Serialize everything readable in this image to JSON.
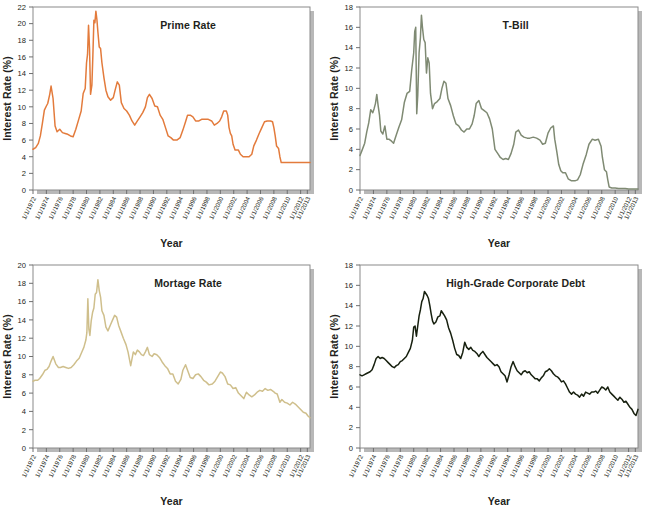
{
  "figure": {
    "name": "interest-rate-history-panels",
    "panel_count": 4,
    "background": "#ffffff"
  },
  "axis_common": {
    "ylabel": "Interest Rate (%)",
    "xlabel": "Year",
    "grid": false,
    "legend": "none",
    "xtick_labels": [
      "1/1/1972",
      "1/1/1974",
      "1/1/1976",
      "1/1/1978",
      "1/1/1980",
      "1/1/1982",
      "1/1/1984",
      "1/1/1986",
      "1/1/1988",
      "1/1/1990",
      "1/1/1992",
      "1/1/1994",
      "1/1/1996",
      "1/1/1998",
      "1/1/2000",
      "1/1/2002",
      "1/1/2004",
      "1/1/2006",
      "1/1/2008",
      "1/1/2010",
      "1/1/2012",
      "1/1/2013"
    ],
    "xtick_values": [
      1972,
      1974,
      1976,
      1978,
      1980,
      1982,
      1984,
      1986,
      1988,
      1990,
      1992,
      1994,
      1996,
      1998,
      2000,
      2002,
      2004,
      2006,
      2008,
      2010,
      2012,
      2013
    ],
    "xlim": [
      1972,
      2013.4
    ]
  },
  "chart_data": [
    {
      "type": "line",
      "panel": "top-left",
      "title": "Prime Rate",
      "color": "#E37B3C",
      "xlabel": "Year",
      "ylabel": "Interest Rate (%)",
      "xlim": [
        1972,
        2013.4
      ],
      "ylim": [
        0,
        22
      ],
      "ytick_values": [
        0,
        2,
        4,
        6,
        8,
        10,
        12,
        14,
        16,
        18,
        20,
        22
      ],
      "ytick_labels": [
        "0",
        "2",
        "4",
        "6",
        "8",
        "10",
        "12",
        "14",
        "16",
        "18",
        "20",
        "22"
      ],
      "x": [
        1972.0,
        1972.4,
        1972.8,
        1973.1,
        1973.4,
        1973.7,
        1974.0,
        1974.2,
        1974.5,
        1974.7,
        1975.0,
        1975.3,
        1975.6,
        1976.0,
        1976.4,
        1976.8,
        1977.2,
        1977.6,
        1978.0,
        1978.4,
        1978.8,
        1979.2,
        1979.5,
        1979.8,
        1980.0,
        1980.15,
        1980.3,
        1980.45,
        1980.6,
        1980.8,
        1980.95,
        1981.1,
        1981.25,
        1981.4,
        1981.55,
        1981.7,
        1981.9,
        1982.1,
        1982.3,
        1982.6,
        1982.9,
        1983.2,
        1983.6,
        1984.0,
        1984.3,
        1984.6,
        1984.9,
        1985.2,
        1985.6,
        1986.0,
        1986.4,
        1986.8,
        1987.2,
        1987.6,
        1988.0,
        1988.4,
        1988.8,
        1989.1,
        1989.4,
        1989.8,
        1990.2,
        1990.6,
        1991.0,
        1991.4,
        1991.8,
        1992.2,
        1992.6,
        1993.0,
        1993.5,
        1994.0,
        1994.4,
        1994.8,
        1995.1,
        1995.5,
        1995.9,
        1996.3,
        1996.8,
        1997.2,
        1997.7,
        1998.2,
        1998.7,
        1999.1,
        1999.5,
        1999.9,
        2000.2,
        2000.5,
        2000.9,
        2001.1,
        2001.3,
        2001.5,
        2001.7,
        2001.9,
        2002.2,
        2002.7,
        2003.0,
        2003.4,
        2003.8,
        2004.3,
        2004.7,
        2005.0,
        2005.4,
        2005.8,
        2006.2,
        2006.6,
        2007.0,
        2007.5,
        2007.8,
        2008.0,
        2008.2,
        2008.4,
        2008.7,
        2008.9,
        2009.1,
        2009.5,
        2010.0,
        2010.5,
        2011.0,
        2011.5,
        2012.0,
        2012.5,
        2013.0,
        2013.4
      ],
      "y": [
        4.9,
        5.1,
        5.6,
        6.5,
        8.0,
        9.6,
        10.1,
        10.4,
        11.5,
        12.5,
        11.0,
        7.7,
        7.0,
        7.3,
        6.9,
        6.8,
        6.7,
        6.5,
        6.4,
        7.3,
        8.4,
        9.5,
        11.6,
        12.2,
        15.3,
        16.3,
        19.8,
        17.0,
        11.5,
        12.6,
        16.2,
        20.4,
        20.1,
        21.5,
        20.5,
        19.0,
        17.2,
        17.0,
        15.3,
        13.5,
        12.0,
        11.2,
        10.8,
        11.1,
        12.1,
        13.0,
        12.6,
        10.5,
        9.8,
        9.5,
        9.0,
        8.3,
        7.8,
        8.3,
        8.8,
        9.3,
        10.0,
        11.1,
        11.5,
        11.0,
        10.1,
        10.0,
        9.0,
        8.5,
        7.5,
        6.5,
        6.3,
        6.0,
        6.0,
        6.3,
        7.2,
        8.2,
        9.0,
        9.0,
        8.8,
        8.3,
        8.3,
        8.5,
        8.5,
        8.5,
        8.3,
        7.8,
        8.0,
        8.3,
        8.8,
        9.5,
        9.5,
        9.0,
        7.5,
        6.8,
        6.5,
        5.5,
        4.8,
        4.8,
        4.3,
        4.0,
        4.0,
        4.0,
        4.3,
        5.3,
        6.0,
        6.8,
        7.5,
        8.2,
        8.3,
        8.3,
        8.2,
        7.5,
        6.5,
        5.3,
        5.0,
        4.0,
        3.3,
        3.3,
        3.3,
        3.3,
        3.3,
        3.3,
        3.3,
        3.3,
        3.3,
        3.3
      ]
    },
    {
      "type": "line",
      "panel": "top-right",
      "title": "T-Bill",
      "color": "#7F8A73",
      "xlabel": "Year",
      "ylabel": "Interest Rate (%)",
      "xlim": [
        1972,
        2013.4
      ],
      "ylim": [
        0,
        18
      ],
      "ytick_values": [
        0,
        2,
        4,
        6,
        8,
        10,
        12,
        14,
        16,
        18
      ],
      "ytick_labels": [
        "0",
        "2",
        "4",
        "6",
        "8",
        "10",
        "12",
        "14",
        "16",
        "18"
      ],
      "x": [
        1972.0,
        1972.3,
        1972.7,
        1973.0,
        1973.3,
        1973.6,
        1973.9,
        1974.1,
        1974.3,
        1974.5,
        1974.7,
        1974.9,
        1975.1,
        1975.4,
        1975.7,
        1976.0,
        1976.3,
        1976.7,
        1977.0,
        1977.4,
        1977.8,
        1978.2,
        1978.6,
        1979.0,
        1979.4,
        1979.7,
        1980.0,
        1980.15,
        1980.3,
        1980.45,
        1980.6,
        1980.8,
        1981.0,
        1981.15,
        1981.3,
        1981.5,
        1981.7,
        1981.9,
        1982.1,
        1982.3,
        1982.5,
        1982.8,
        1983.1,
        1983.5,
        1983.9,
        1984.2,
        1984.5,
        1984.8,
        1985.1,
        1985.5,
        1985.9,
        1986.3,
        1986.7,
        1987.1,
        1987.5,
        1987.9,
        1988.3,
        1988.7,
        1989.0,
        1989.3,
        1989.7,
        1990.1,
        1990.5,
        1990.9,
        1991.3,
        1991.7,
        1992.1,
        1992.5,
        1992.9,
        1993.3,
        1993.7,
        1994.1,
        1994.5,
        1994.9,
        1995.2,
        1995.6,
        1996.0,
        1996.4,
        1996.9,
        1997.3,
        1997.8,
        1998.3,
        1998.8,
        1999.2,
        1999.6,
        2000.0,
        2000.4,
        2000.8,
        2001.0,
        2001.3,
        2001.6,
        2001.9,
        2002.2,
        2002.6,
        2003.0,
        2003.5,
        2004.0,
        2004.4,
        2004.8,
        2005.2,
        2005.7,
        2006.1,
        2006.6,
        2007.0,
        2007.5,
        2007.9,
        2008.1,
        2008.4,
        2008.7,
        2008.9,
        2009.1,
        2009.5,
        2010.0,
        2010.5,
        2011.0,
        2011.5,
        2012.0,
        2012.5,
        2013.0,
        2013.4
      ],
      "y": [
        3.4,
        3.9,
        4.6,
        5.7,
        6.6,
        7.9,
        7.6,
        8.0,
        8.5,
        9.4,
        8.3,
        7.4,
        5.8,
        5.5,
        6.3,
        5.0,
        5.0,
        4.8,
        4.6,
        5.4,
        6.2,
        6.9,
        8.6,
        9.5,
        9.7,
        11.8,
        13.5,
        15.6,
        16.0,
        7.5,
        9.3,
        13.5,
        15.0,
        17.2,
        16.0,
        14.8,
        14.5,
        11.5,
        13.0,
        12.5,
        9.5,
        8.0,
        8.5,
        8.7,
        9.0,
        10.0,
        10.7,
        10.5,
        9.0,
        8.3,
        7.3,
        6.5,
        6.3,
        5.9,
        5.7,
        6.0,
        6.0,
        6.5,
        7.3,
        8.5,
        8.8,
        8.0,
        7.8,
        7.6,
        7.0,
        6.0,
        4.0,
        3.6,
        3.2,
        3.0,
        3.1,
        3.0,
        3.6,
        4.5,
        5.7,
        5.9,
        5.4,
        5.2,
        5.1,
        5.1,
        5.2,
        5.1,
        4.9,
        4.5,
        4.6,
        5.6,
        6.1,
        6.3,
        5.0,
        3.8,
        2.5,
        1.9,
        1.7,
        1.7,
        1.1,
        0.9,
        0.9,
        1.0,
        1.5,
        2.5,
        3.5,
        4.5,
        5.0,
        4.9,
        5.0,
        4.3,
        3.2,
        2.0,
        1.8,
        1.0,
        0.3,
        0.2,
        0.2,
        0.15,
        0.15,
        0.15,
        0.1,
        0.1,
        0.1,
        0.1,
        0.08,
        0.08
      ]
    },
    {
      "type": "line",
      "panel": "bottom-left",
      "title": "Mortage Rate",
      "color": "#CFBF8C",
      "xlabel": "Year",
      "ylabel": "Interest Rate (%)",
      "xlim": [
        1972,
        2013.4
      ],
      "ylim": [
        0,
        20
      ],
      "ytick_values": [
        0,
        2,
        4,
        6,
        8,
        10,
        12,
        14,
        16,
        18,
        20
      ],
      "ytick_labels": [
        "0",
        "2",
        "4",
        "6",
        "8",
        "10",
        "12",
        "14",
        "16",
        "18",
        "20"
      ],
      "x": [
        1972.0,
        1972.3,
        1972.7,
        1973.0,
        1973.4,
        1973.8,
        1974.1,
        1974.4,
        1974.7,
        1975.0,
        1975.4,
        1975.8,
        1976.1,
        1976.5,
        1976.9,
        1977.3,
        1977.7,
        1978.1,
        1978.5,
        1978.9,
        1979.3,
        1979.6,
        1979.9,
        1980.05,
        1980.2,
        1980.35,
        1980.5,
        1980.7,
        1980.9,
        1981.1,
        1981.3,
        1981.5,
        1981.7,
        1981.9,
        1982.1,
        1982.3,
        1982.6,
        1982.9,
        1983.2,
        1983.6,
        1983.9,
        1984.2,
        1984.5,
        1984.8,
        1985.1,
        1985.5,
        1985.9,
        1986.2,
        1986.6,
        1987.0,
        1987.3,
        1987.6,
        1987.9,
        1988.2,
        1988.5,
        1988.8,
        1989.1,
        1989.4,
        1989.8,
        1990.1,
        1990.5,
        1990.9,
        1991.3,
        1991.7,
        1992.1,
        1992.5,
        1992.9,
        1993.3,
        1993.7,
        1994.1,
        1994.4,
        1994.8,
        1995.1,
        1995.5,
        1995.9,
        1996.3,
        1996.7,
        1997.1,
        1997.5,
        1997.9,
        1998.3,
        1998.8,
        1999.2,
        1999.6,
        2000.0,
        2000.3,
        2000.7,
        2001.1,
        2001.5,
        2001.9,
        2002.3,
        2002.7,
        2003.1,
        2003.5,
        2003.9,
        2004.3,
        2004.7,
        2005.1,
        2005.5,
        2005.9,
        2006.3,
        2006.7,
        2007.1,
        2007.5,
        2007.9,
        2008.2,
        2008.5,
        2008.9,
        2009.2,
        2009.6,
        2010.0,
        2010.4,
        2010.8,
        2011.2,
        2011.6,
        2012.0,
        2012.4,
        2012.8,
        2013.1,
        2013.4
      ],
      "y": [
        7.3,
        7.4,
        7.4,
        7.6,
        8.0,
        8.5,
        8.6,
        8.9,
        9.5,
        10.0,
        9.2,
        8.8,
        8.8,
        8.9,
        8.8,
        8.7,
        8.8,
        9.1,
        9.5,
        9.8,
        10.5,
        11.0,
        11.8,
        12.6,
        16.3,
        13.0,
        12.3,
        13.9,
        14.8,
        15.3,
        16.8,
        17.0,
        18.4,
        17.2,
        16.5,
        15.0,
        14.5,
        13.2,
        12.8,
        13.5,
        14.0,
        14.5,
        14.3,
        13.4,
        12.8,
        12.0,
        11.3,
        10.5,
        9.0,
        10.5,
        10.2,
        10.7,
        10.5,
        10.2,
        10.1,
        10.5,
        11.0,
        10.2,
        10.0,
        10.3,
        10.2,
        9.9,
        9.4,
        9.0,
        8.7,
        8.1,
        8.1,
        7.3,
        7.0,
        7.5,
        8.5,
        9.1,
        8.5,
        7.7,
        7.6,
        8.0,
        8.1,
        7.8,
        7.4,
        7.2,
        6.9,
        7.0,
        7.3,
        7.8,
        8.3,
        8.2,
        7.8,
        7.0,
        6.9,
        6.5,
        6.6,
        6.0,
        5.7,
        5.4,
        6.1,
        5.8,
        5.6,
        5.8,
        6.1,
        6.3,
        6.2,
        6.5,
        6.3,
        6.4,
        6.2,
        6.0,
        5.9,
        5.0,
        5.3,
        5.0,
        4.9,
        4.7,
        5.0,
        4.8,
        4.5,
        4.2,
        3.9,
        3.8,
        3.5,
        3.3,
        3.1
      ]
    },
    {
      "type": "line",
      "panel": "bottom-right",
      "title": "High-Grade Corporate Debt",
      "color": "#17200F",
      "xlabel": "Year",
      "ylabel": "Interest Rate (%)",
      "xlim": [
        1972,
        2013.4
      ],
      "ylim": [
        0,
        18
      ],
      "ytick_values": [
        0,
        2,
        4,
        6,
        8,
        10,
        12,
        14,
        16,
        18
      ],
      "ytick_labels": [
        "0",
        "2",
        "4",
        "6",
        "8",
        "10",
        "12",
        "14",
        "16",
        "18"
      ],
      "x": [
        1972.0,
        1972.3,
        1972.6,
        1972.9,
        1973.2,
        1973.5,
        1973.8,
        1974.1,
        1974.4,
        1974.7,
        1975.0,
        1975.3,
        1975.6,
        1975.9,
        1976.2,
        1976.5,
        1976.8,
        1977.1,
        1977.4,
        1977.7,
        1978.0,
        1978.3,
        1978.6,
        1978.9,
        1979.2,
        1979.5,
        1979.8,
        1980.0,
        1980.2,
        1980.4,
        1980.6,
        1980.8,
        1981.0,
        1981.2,
        1981.4,
        1981.6,
        1981.8,
        1982.0,
        1982.2,
        1982.4,
        1982.6,
        1982.8,
        1983.0,
        1983.3,
        1983.6,
        1983.9,
        1984.1,
        1984.3,
        1984.6,
        1984.9,
        1985.2,
        1985.5,
        1985.8,
        1986.1,
        1986.4,
        1986.7,
        1987.0,
        1987.3,
        1987.6,
        1987.9,
        1988.2,
        1988.5,
        1988.8,
        1989.1,
        1989.4,
        1989.7,
        1990.0,
        1990.3,
        1990.6,
        1990.9,
        1991.2,
        1991.5,
        1991.8,
        1992.1,
        1992.4,
        1992.7,
        1993.0,
        1993.3,
        1993.6,
        1993.9,
        1994.2,
        1994.5,
        1994.8,
        1995.1,
        1995.4,
        1995.7,
        1996.0,
        1996.3,
        1996.6,
        1996.9,
        1997.2,
        1997.5,
        1997.8,
        1998.1,
        1998.4,
        1998.7,
        1999.0,
        1999.3,
        1999.6,
        1999.9,
        2000.2,
        2000.5,
        2000.8,
        2001.1,
        2001.4,
        2001.7,
        2002.0,
        2002.3,
        2002.6,
        2002.9,
        2003.2,
        2003.5,
        2003.8,
        2004.1,
        2004.4,
        2004.7,
        2005.0,
        2005.3,
        2005.6,
        2005.9,
        2006.2,
        2006.5,
        2006.8,
        2007.1,
        2007.4,
        2007.7,
        2008.0,
        2008.3,
        2008.6,
        2008.9,
        2009.2,
        2009.5,
        2009.8,
        2010.1,
        2010.4,
        2010.7,
        2011.0,
        2011.3,
        2011.6,
        2011.9,
        2012.2,
        2012.5,
        2012.8,
        2013.1,
        2013.4
      ],
      "y": [
        7.2,
        7.1,
        7.2,
        7.3,
        7.4,
        7.5,
        7.7,
        8.2,
        8.8,
        9.0,
        8.8,
        8.9,
        8.8,
        8.6,
        8.4,
        8.2,
        8.0,
        7.9,
        8.1,
        8.2,
        8.5,
        8.6,
        8.8,
        9.0,
        9.4,
        9.8,
        10.6,
        11.9,
        12.0,
        11.0,
        12.0,
        13.0,
        13.6,
        14.4,
        14.7,
        15.4,
        15.2,
        15.0,
        14.7,
        14.0,
        13.2,
        12.5,
        12.2,
        12.4,
        12.9,
        13.0,
        13.5,
        13.3,
        13.0,
        12.6,
        11.8,
        11.3,
        10.6,
        9.8,
        9.2,
        9.1,
        8.8,
        9.4,
        10.4,
        9.9,
        9.7,
        9.9,
        9.6,
        9.5,
        9.3,
        9.0,
        9.3,
        9.5,
        9.2,
        8.9,
        8.7,
        8.5,
        8.3,
        8.1,
        8.2,
        8.0,
        7.5,
        7.3,
        7.1,
        6.5,
        7.2,
        8.0,
        8.5,
        8.0,
        7.6,
        7.4,
        7.2,
        7.5,
        7.6,
        7.4,
        7.5,
        7.2,
        7.0,
        6.8,
        6.8,
        6.6,
        6.9,
        7.1,
        7.5,
        7.6,
        7.8,
        7.6,
        7.3,
        7.1,
        7.0,
        6.8,
        6.5,
        6.6,
        6.3,
        5.9,
        5.5,
        5.3,
        5.5,
        5.3,
        5.2,
        5.0,
        5.3,
        5.1,
        5.5,
        5.4,
        5.3,
        5.5,
        5.5,
        5.6,
        5.4,
        5.7,
        6.0,
        5.9,
        5.7,
        6.0,
        5.5,
        5.3,
        5.1,
        4.9,
        4.7,
        5.0,
        4.8,
        4.5,
        4.6,
        4.3,
        4.0,
        3.8,
        3.4,
        3.2,
        3.8
      ]
    }
  ]
}
